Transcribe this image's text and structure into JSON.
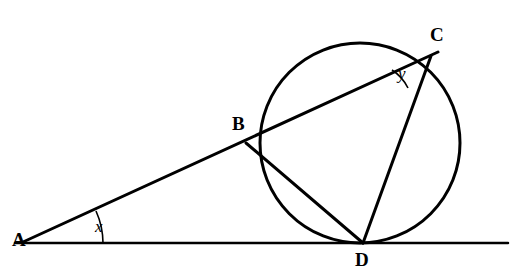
{
  "figure": {
    "stroke_color": "#000000",
    "background_color": "#ffffff",
    "points": {
      "A": {
        "label": "A",
        "x": 23,
        "y": 242
      },
      "B": {
        "label": "B",
        "x": 246,
        "y": 143
      },
      "C": {
        "label": "C",
        "x": 430,
        "y": 57
      },
      "D": {
        "label": "D",
        "x": 363,
        "y": 243
      }
    },
    "labels": {
      "A": {
        "text": "A",
        "left": 12,
        "top": 230
      },
      "B": {
        "text": "B",
        "left": 232,
        "top": 114
      },
      "C": {
        "text": "C",
        "left": 430,
        "top": 25
      },
      "D": {
        "text": "D",
        "left": 355,
        "top": 250
      }
    },
    "angles": {
      "x": {
        "text": "x",
        "left": 95,
        "top": 218
      },
      "y": {
        "text": "y",
        "left": 398,
        "top": 65
      }
    },
    "circle": {
      "cx": 360,
      "cy": 143,
      "r": 100
    },
    "baseline": {
      "x1": 15,
      "y1": 243,
      "x2": 508,
      "y2": 243
    },
    "segments": [
      {
        "name": "A-to-C",
        "x1": 23,
        "y1": 242,
        "x2": 437,
        "y2": 53
      },
      {
        "name": "B-to-D",
        "x1": 246,
        "y1": 143,
        "x2": 363,
        "y2": 243
      },
      {
        "name": "C-to-D",
        "x1": 430,
        "y1": 57,
        "x2": 363,
        "y2": 243
      }
    ]
  }
}
